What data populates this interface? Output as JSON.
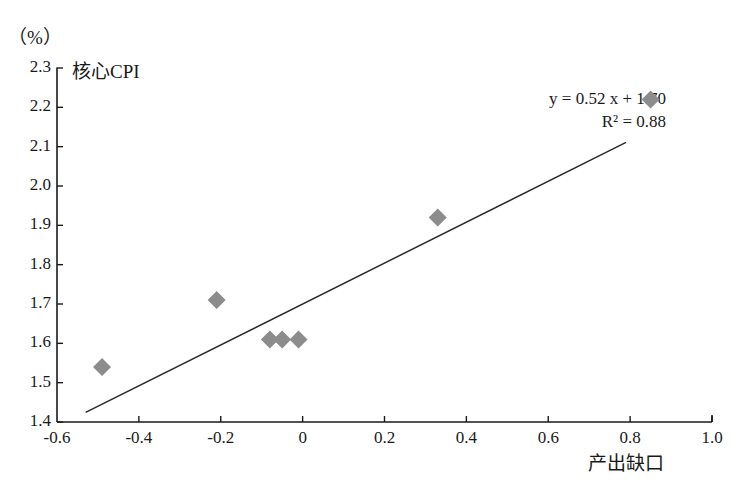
{
  "figure": {
    "unit_label": "（%）",
    "series_label": "核心CPI",
    "equation_line1": "y = 0.52 x + 1.70",
    "equation_line2": "R² = 0.88",
    "x_axis_title": "产出缺口",
    "marker_color": "#8c8c8c",
    "line_color": "#2b2b2b",
    "axis_color": "#1a1a1a",
    "background": "#ffffff"
  },
  "chart_data": {
    "type": "scatter",
    "title": "",
    "subtitle": "",
    "xlabel": "产出缺口",
    "ylabel": "核心CPI",
    "unit": "%",
    "xlim": [
      -0.6,
      1.0
    ],
    "ylim": [
      1.4,
      2.3
    ],
    "xticks": [
      -0.6,
      -0.4,
      -0.2,
      0,
      0.2,
      0.4,
      0.6,
      0.8,
      1.0
    ],
    "xtick_labels": [
      "-0.6",
      "-0.4",
      "-0.2",
      "0",
      "0.2",
      "0.4",
      "0.6",
      "0.8",
      "1.0"
    ],
    "yticks": [
      1.4,
      1.5,
      1.6,
      1.7,
      1.8,
      1.9,
      2.0,
      2.1,
      2.2,
      2.3
    ],
    "ytick_labels": [
      "1.4",
      "1.5",
      "1.6",
      "1.7",
      "1.8",
      "1.9",
      "2.0",
      "2.1",
      "2.2",
      "2.3"
    ],
    "grid": false,
    "legend": false,
    "legend_position": "none",
    "marker": "diamond",
    "points": [
      {
        "x": -0.49,
        "y": 1.54
      },
      {
        "x": -0.21,
        "y": 1.71
      },
      {
        "x": -0.08,
        "y": 1.61
      },
      {
        "x": -0.05,
        "y": 1.61
      },
      {
        "x": -0.01,
        "y": 1.61
      },
      {
        "x": 0.33,
        "y": 1.92
      },
      {
        "x": 0.85,
        "y": 2.22
      }
    ],
    "trendline": {
      "type": "linear",
      "slope": 0.52,
      "intercept": 1.7,
      "equation": "y = 0.52 x + 1.70",
      "r_squared": 0.88,
      "r_squared_label": "R² = 0.88",
      "x_start": -0.53,
      "x_end": 0.79
    },
    "annotations": [
      {
        "text": "核心CPI",
        "x": -0.49,
        "y": 2.26
      },
      {
        "text": "y = 0.52 x + 1.70",
        "x": 0.62,
        "y": 2.2
      },
      {
        "text": "R² = 0.88",
        "x": 0.62,
        "y": 2.14
      }
    ]
  }
}
